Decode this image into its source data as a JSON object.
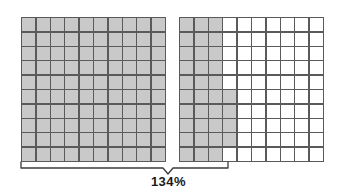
{
  "figure": {
    "type": "percent-grid-model",
    "label": "134%",
    "grid_columns": 10,
    "grid_rows": 10,
    "cells_per_grid": 100,
    "shaded_color": "#c9c9c9",
    "unshaded_color": "#ffffff",
    "gridline_color": "#5a5a5a",
    "brace_color": "#3a3a3a",
    "label_color": "#1a1a1a",
    "grids": [
      {
        "name": "left-grid",
        "shaded_count": 100,
        "percent": "100%",
        "fully_shaded": true,
        "shaded_rows": [
          [
            1,
            1,
            1,
            1,
            1,
            1,
            1,
            1,
            1,
            1
          ],
          [
            1,
            1,
            1,
            1,
            1,
            1,
            1,
            1,
            1,
            1
          ],
          [
            1,
            1,
            1,
            1,
            1,
            1,
            1,
            1,
            1,
            1
          ],
          [
            1,
            1,
            1,
            1,
            1,
            1,
            1,
            1,
            1,
            1
          ],
          [
            1,
            1,
            1,
            1,
            1,
            1,
            1,
            1,
            1,
            1
          ],
          [
            1,
            1,
            1,
            1,
            1,
            1,
            1,
            1,
            1,
            1
          ],
          [
            1,
            1,
            1,
            1,
            1,
            1,
            1,
            1,
            1,
            1
          ],
          [
            1,
            1,
            1,
            1,
            1,
            1,
            1,
            1,
            1,
            1
          ],
          [
            1,
            1,
            1,
            1,
            1,
            1,
            1,
            1,
            1,
            1
          ],
          [
            1,
            1,
            1,
            1,
            1,
            1,
            1,
            1,
            1,
            1
          ]
        ]
      },
      {
        "name": "right-grid",
        "shaded_count": 34,
        "percent": "34%",
        "fully_shaded": false,
        "shaded_rows": [
          [
            1,
            1,
            1,
            0,
            0,
            0,
            0,
            0,
            0,
            0
          ],
          [
            1,
            1,
            1,
            0,
            0,
            0,
            0,
            0,
            0,
            0
          ],
          [
            1,
            1,
            1,
            0,
            0,
            0,
            0,
            0,
            0,
            0
          ],
          [
            1,
            1,
            1,
            0,
            0,
            0,
            0,
            0,
            0,
            0
          ],
          [
            1,
            1,
            1,
            0,
            0,
            0,
            0,
            0,
            0,
            0
          ],
          [
            1,
            1,
            1,
            1,
            0,
            0,
            0,
            0,
            0,
            0
          ],
          [
            1,
            1,
            1,
            1,
            0,
            0,
            0,
            0,
            0,
            0
          ],
          [
            1,
            1,
            1,
            1,
            0,
            0,
            0,
            0,
            0,
            0
          ],
          [
            1,
            1,
            1,
            1,
            0,
            0,
            0,
            0,
            0,
            0
          ],
          [
            1,
            1,
            1,
            0,
            0,
            0,
            0,
            0,
            0,
            0
          ]
        ]
      }
    ],
    "total_shaded": 134
  }
}
